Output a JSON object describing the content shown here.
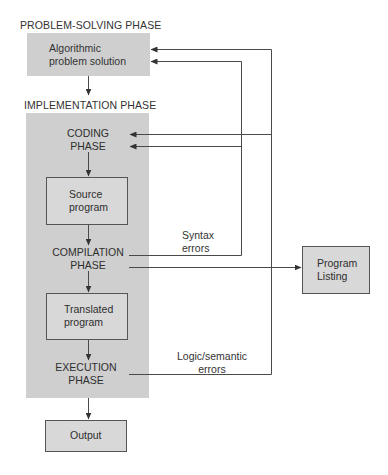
{
  "diagram": {
    "problem_solving": {
      "heading": "PROBLEM-SOLVING PHASE",
      "box_line1": "Algorithmic",
      "box_line2": "problem solution"
    },
    "implementation": {
      "heading": "IMPLEMENTATION PHASE",
      "coding": {
        "line1": "CODING",
        "line2": "PHASE"
      },
      "source_program": {
        "line1": "Source",
        "line2": "program"
      },
      "compilation": {
        "line1": "COMPILATION",
        "line2": "PHASE"
      },
      "translated_program": {
        "line1": "Translated",
        "line2": "program"
      },
      "execution": {
        "line1": "EXECUTION",
        "line2": "PHASE"
      }
    },
    "output": {
      "label": "Output"
    },
    "program_listing": {
      "line1": "Program",
      "line2": "Listing"
    },
    "feedback": {
      "syntax_errors": {
        "line1": "Syntax",
        "line2": "errors"
      },
      "logic_errors": {
        "line1": "Logic/semantic",
        "line2": "errors"
      }
    },
    "colors": {
      "phase_fill": "#cfcfcf",
      "box_fill": "#d8d8d8",
      "line": "#444444"
    }
  }
}
